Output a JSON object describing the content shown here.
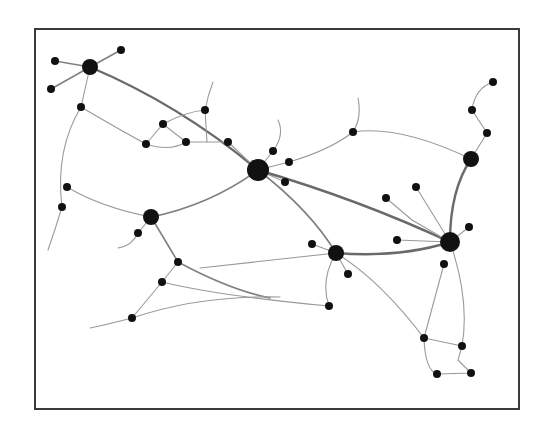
{
  "diagram": {
    "type": "network-graph",
    "style": {
      "node_color": "#111111",
      "edge_color": "#7a7a7a",
      "frame_color": "#3a3a3a",
      "background": "#ffffff"
    },
    "frame": {
      "x": 34,
      "y": 28,
      "width": 486,
      "height": 382
    },
    "hubs": [
      {
        "id": "H1",
        "x": 90,
        "y": 67,
        "r": 8
      },
      {
        "id": "H2",
        "x": 258,
        "y": 170,
        "r": 11
      },
      {
        "id": "H3",
        "x": 471,
        "y": 159,
        "r": 8
      },
      {
        "id": "H4",
        "x": 151,
        "y": 217,
        "r": 8
      },
      {
        "id": "H5",
        "x": 336,
        "y": 253,
        "r": 8
      },
      {
        "id": "H6",
        "x": 450,
        "y": 242,
        "r": 10
      }
    ],
    "nodes": [
      {
        "id": "n1",
        "x": 55,
        "y": 61
      },
      {
        "id": "n2",
        "x": 121,
        "y": 50
      },
      {
        "id": "n3",
        "x": 51,
        "y": 89
      },
      {
        "id": "n4",
        "x": 81,
        "y": 107
      },
      {
        "id": "n5",
        "x": 163,
        "y": 124
      },
      {
        "id": "n6",
        "x": 146,
        "y": 144
      },
      {
        "id": "n7",
        "x": 186,
        "y": 142
      },
      {
        "id": "n8",
        "x": 205,
        "y": 110
      },
      {
        "id": "n9",
        "x": 228,
        "y": 142
      },
      {
        "id": "n10",
        "x": 273,
        "y": 151
      },
      {
        "id": "n11",
        "x": 289,
        "y": 162
      },
      {
        "id": "n12",
        "x": 285,
        "y": 182
      },
      {
        "id": "n13",
        "x": 353,
        "y": 132
      },
      {
        "id": "n14",
        "x": 493,
        "y": 82
      },
      {
        "id": "n15",
        "x": 472,
        "y": 110
      },
      {
        "id": "n16",
        "x": 487,
        "y": 133
      },
      {
        "id": "n17",
        "x": 67,
        "y": 187
      },
      {
        "id": "n18",
        "x": 62,
        "y": 207
      },
      {
        "id": "n19",
        "x": 138,
        "y": 233
      },
      {
        "id": "n20",
        "x": 178,
        "y": 262
      },
      {
        "id": "n21",
        "x": 162,
        "y": 282
      },
      {
        "id": "n22",
        "x": 132,
        "y": 318
      },
      {
        "id": "n23",
        "x": 312,
        "y": 244
      },
      {
        "id": "n24",
        "x": 348,
        "y": 274
      },
      {
        "id": "n25",
        "x": 329,
        "y": 306
      },
      {
        "id": "n26",
        "x": 386,
        "y": 198
      },
      {
        "id": "n27",
        "x": 416,
        "y": 187
      },
      {
        "id": "n28",
        "x": 397,
        "y": 240
      },
      {
        "id": "n29",
        "x": 469,
        "y": 227
      },
      {
        "id": "n30",
        "x": 444,
        "y": 264
      },
      {
        "id": "n31",
        "x": 424,
        "y": 338
      },
      {
        "id": "n32",
        "x": 462,
        "y": 346
      },
      {
        "id": "n33",
        "x": 437,
        "y": 374
      },
      {
        "id": "n34",
        "x": 471,
        "y": 373
      }
    ],
    "edges": [
      {
        "d": "M90,67 L55,61",
        "w": "med"
      },
      {
        "d": "M90,67 L121,50",
        "w": "med"
      },
      {
        "d": "M90,67 L51,89",
        "w": "med"
      },
      {
        "d": "M90,67 L81,107",
        "w": "thin"
      },
      {
        "d": "M90,67 Q180,105 258,170",
        "w": "thick"
      },
      {
        "d": "M81,107 Q120,130 146,144",
        "w": "thin"
      },
      {
        "d": "M146,144 L163,124 L186,142",
        "w": "thin"
      },
      {
        "d": "M146,144 Q170,152 186,142 L228,142",
        "w": "thin"
      },
      {
        "d": "M163,124 Q185,112 205,110 L207,142",
        "w": "thin"
      },
      {
        "d": "M205,110 Q208,95 213,82",
        "w": "thin"
      },
      {
        "d": "M228,142 L258,170",
        "w": "thin"
      },
      {
        "d": "M81,107 Q55,150 62,207",
        "w": "thin"
      },
      {
        "d": "M67,187 Q100,207 151,217",
        "w": "thin"
      },
      {
        "d": "M62,207 Q55,230 48,250",
        "w": "thin"
      },
      {
        "d": "M151,217 Q210,205 258,170",
        "w": "med"
      },
      {
        "d": "M151,217 L138,233 Q132,246 118,248",
        "w": "thin"
      },
      {
        "d": "M258,170 L273,151 Q285,135 278,120",
        "w": "thin"
      },
      {
        "d": "M258,170 L289,162 Q330,150 353,132 Q362,118 358,98",
        "w": "thin"
      },
      {
        "d": "M353,132 Q400,125 471,159",
        "w": "thin"
      },
      {
        "d": "M258,170 L285,182",
        "w": "thin"
      },
      {
        "d": "M258,170 Q360,200 450,242",
        "w": "thick"
      },
      {
        "d": "M258,170 Q310,210 336,253",
        "w": "med"
      },
      {
        "d": "M471,159 L487,133 L472,110 Q475,88 493,82",
        "w": "thin"
      },
      {
        "d": "M471,159 Q450,190 450,242",
        "w": "thick"
      },
      {
        "d": "M386,198 L412,220 L450,242",
        "w": "thin"
      },
      {
        "d": "M416,187 L450,242",
        "w": "thin"
      },
      {
        "d": "M397,240 L450,242",
        "w": "thin"
      },
      {
        "d": "M450,242 L469,227",
        "w": "thin"
      },
      {
        "d": "M336,253 Q400,258 450,242",
        "w": "thick"
      },
      {
        "d": "M336,253 L312,244",
        "w": "thin"
      },
      {
        "d": "M336,253 L348,274",
        "w": "thin"
      },
      {
        "d": "M336,253 Q320,280 329,306",
        "w": "thin"
      },
      {
        "d": "M336,253 Q255,262 200,268",
        "w": "thin"
      },
      {
        "d": "M151,217 Q168,245 178,262 Q230,290 270,298",
        "w": "med"
      },
      {
        "d": "M178,262 L162,282 L132,318",
        "w": "thin"
      },
      {
        "d": "M162,282 Q220,296 329,306",
        "w": "thin"
      },
      {
        "d": "M132,318 Q200,295 280,297",
        "w": "thin"
      },
      {
        "d": "M132,318 Q105,325 90,328",
        "w": "thin"
      },
      {
        "d": "M336,253 Q380,280 424,338",
        "w": "thin"
      },
      {
        "d": "M444,264 L424,338",
        "w": "thin"
      },
      {
        "d": "M450,242 Q470,300 462,346",
        "w": "thin"
      },
      {
        "d": "M424,338 L462,346",
        "w": "thin"
      },
      {
        "d": "M424,338 Q425,370 437,374 L471,373 L458,360 L462,346",
        "w": "thin"
      }
    ]
  }
}
